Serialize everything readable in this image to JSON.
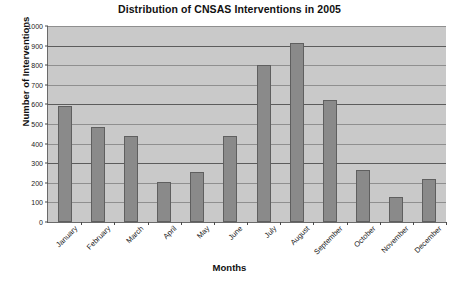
{
  "chart_data": {
    "type": "bar",
    "title": "Distribution of CNSAS Interventions in 2005",
    "xlabel": "Months",
    "ylabel": "Number of Interventions",
    "categories": [
      "January",
      "February",
      "March",
      "April",
      "May",
      "June",
      "July",
      "August",
      "September",
      "October",
      "November",
      "December"
    ],
    "values": [
      590,
      485,
      440,
      205,
      255,
      440,
      800,
      915,
      625,
      265,
      130,
      220
    ],
    "ylim": [
      0,
      1000
    ],
    "yticks": [
      0,
      100,
      200,
      300,
      400,
      500,
      600,
      700,
      800,
      900,
      1000
    ],
    "ytick_labels": [
      "0",
      "100",
      "200",
      "300",
      "400",
      "500",
      "600",
      "700",
      "800",
      "900",
      "1000"
    ],
    "grid": true,
    "legend": false,
    "bar_color": "#8a8a8a",
    "bar_edge_color": "#5f5f5f",
    "plot_background": "#c9c9c9",
    "gridline_color": "#8f8f8f",
    "figure_background": "#ffffff"
  }
}
